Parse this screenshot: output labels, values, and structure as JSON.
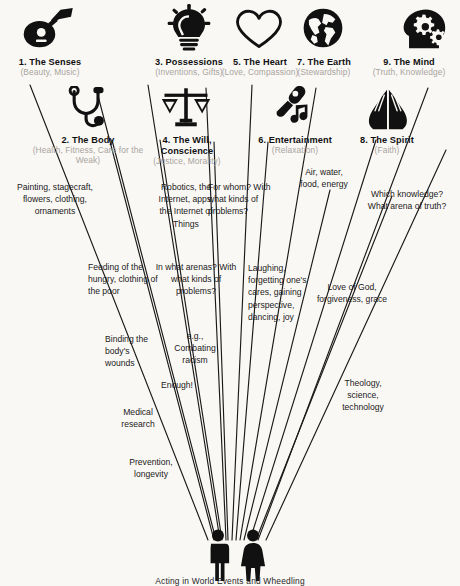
{
  "diagram": {
    "title_caption": "Acting in World Events and Wheedling",
    "background_color": "#faf8f5",
    "ink_color": "#111111",
    "muted_color": "#a8a49e",
    "headings": [
      {
        "id": "senses",
        "number": "1.",
        "name": "The Senses",
        "title": "1. The Senses",
        "subtitle": "(Beauty, Music)",
        "icon": "guitar-icon"
      },
      {
        "id": "body",
        "number": "2.",
        "name": "The Body",
        "title": "2. The Body",
        "subtitle": "(Health, Fitness, Care for the Weak)",
        "icon": "stethoscope-icon"
      },
      {
        "id": "possessions",
        "number": "3.",
        "name": "Possessions",
        "title": "3. Possessions",
        "subtitle": "(Inventions, Gifts)",
        "icon": "lightbulb-icon"
      },
      {
        "id": "will",
        "number": "4.",
        "name": "The Will, Conscience",
        "title": "4. The Will, Conscience",
        "subtitle": "(Justice, Morality)",
        "icon": "scales-icon"
      },
      {
        "id": "heart",
        "number": "5.",
        "name": "The Heart",
        "title": "5. The Heart",
        "subtitle": "(Love, Compassion)",
        "icon": "heart-icon"
      },
      {
        "id": "entertainment",
        "number": "6.",
        "name": "Entertainment",
        "title": "6. Entertainment",
        "subtitle": "(Relaxation)",
        "icon": "microphone-music-icon"
      },
      {
        "id": "earth",
        "number": "7.",
        "name": "The Earth",
        "title": "7. The Earth",
        "subtitle": "(Stewardship)",
        "icon": "globe-icon"
      },
      {
        "id": "spirit",
        "number": "8.",
        "name": "The Spirit",
        "title": "8. The Spirit",
        "subtitle": "(Faith)",
        "icon": "praying-hands-icon"
      },
      {
        "id": "mind",
        "number": "9.",
        "name": "The Mind",
        "title": "9. The Mind",
        "subtitle": "(Truth, Knowledge)",
        "icon": "head-gears-icon"
      }
    ],
    "notes": [
      {
        "id": "n1",
        "branch": "senses",
        "text": "Painting, stagecraft, flowers, clothing, ornaments"
      },
      {
        "id": "n2",
        "branch": "possessions",
        "text": "Robotics, the Internet, apps, the Internet of Things"
      },
      {
        "id": "n3",
        "branch": "will",
        "text": "For whom? With what kinds of problems?"
      },
      {
        "id": "n4",
        "branch": "earth",
        "text": "Air, water, food, energy"
      },
      {
        "id": "n5",
        "branch": "mind",
        "text": "Which knowledge? What arena of truth?"
      },
      {
        "id": "n6",
        "branch": "body",
        "text": "Feeding of the hungry, clothing of the poor"
      },
      {
        "id": "n7",
        "branch": "possessions",
        "text": "In what arenas? With what kinds of problems?"
      },
      {
        "id": "n8",
        "branch": "heart",
        "text": "Laughing, forgetting one's cares, gaining perspective, dancing, joy"
      },
      {
        "id": "n9",
        "branch": "spirit",
        "text": "Love of God, forgiveness, grace"
      },
      {
        "id": "n10",
        "branch": "body",
        "text": "Binding the body's wounds"
      },
      {
        "id": "n11",
        "branch": "will",
        "text": "e.g., Combating racism"
      },
      {
        "id": "n12",
        "branch": "will",
        "text": "Enough!"
      },
      {
        "id": "n13",
        "branch": "mind",
        "text": "Theology, science, technology"
      },
      {
        "id": "n14",
        "branch": "body",
        "text": "Medical research"
      },
      {
        "id": "n15",
        "branch": "body",
        "text": "Prevention, longevity"
      }
    ],
    "figures": [
      {
        "id": "figure-man",
        "label": "man-pictogram"
      },
      {
        "id": "figure-woman",
        "label": "woman-pictogram"
      }
    ]
  }
}
